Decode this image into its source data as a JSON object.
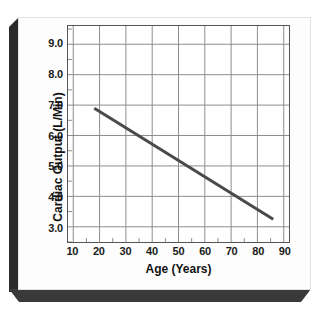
{
  "chart_data": {
    "type": "line",
    "title": "",
    "xlabel": "Age (Years)",
    "ylabel": "Cardiac Output (L/Min)",
    "xlim": [
      8,
      92
    ],
    "ylim": [
      2.5,
      9.6
    ],
    "grid": true,
    "legend": null,
    "x_ticks": [
      10,
      20,
      30,
      40,
      50,
      60,
      70,
      80,
      90
    ],
    "x_tick_labels": [
      "10",
      "20",
      "30",
      "40",
      "50",
      "60",
      "70",
      "80",
      "90"
    ],
    "y_ticks": [
      3.0,
      4.0,
      5.0,
      6.0,
      7.0,
      8.0,
      9.0
    ],
    "y_tick_labels": [
      "3.0",
      "4.0",
      "5.0",
      "6.0",
      "7.0",
      "8.0",
      "9.0"
    ],
    "x_minor_ticks": [
      15,
      25,
      35,
      45,
      55,
      65,
      75,
      85
    ],
    "y_minor_ticks": [
      2.5,
      3.5,
      4.5,
      5.5,
      6.5,
      7.5,
      8.5,
      9.5
    ],
    "series": [
      {
        "name": "Cardiac Output vs Age",
        "color": "#4a4a4a",
        "width": 3,
        "x": [
          18,
          86
        ],
        "values": [
          6.9,
          3.25
        ]
      }
    ]
  },
  "colors": {
    "line": "#4a4a4a",
    "grid": "#8c8c8c",
    "frame": "#555555",
    "text": "#1a1a1a",
    "card": "#fdfdfd",
    "bevel": "#2b2b2b",
    "shadow": "#3a3a3a"
  }
}
